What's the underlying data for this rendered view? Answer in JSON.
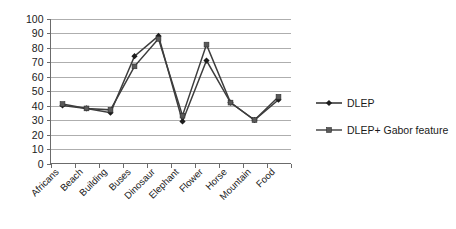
{
  "chart_data": {
    "type": "line",
    "title": "",
    "subtitle": "",
    "xlabel": "",
    "ylabel": "",
    "ylim": [
      0,
      100
    ],
    "ytick_step": 10,
    "yticks": [
      "0",
      "10",
      "20",
      "30",
      "40",
      "50",
      "60",
      "70",
      "80",
      "90",
      "100"
    ],
    "grid": true,
    "legend_position": "right",
    "categories": [
      "Africans",
      "Beach",
      "Building",
      "Buses",
      "Dinosaur",
      "Elephant",
      "Flower",
      "Horse",
      "Mountain",
      "Food"
    ],
    "series": [
      {
        "name": "DLEP",
        "marker": "diamond",
        "color": "#1c1c1c",
        "values": [
          40,
          38,
          35,
          74,
          88,
          29,
          71,
          42,
          30,
          44
        ]
      },
      {
        "name": "DLEP+ Gabor feature",
        "marker": "square",
        "color": "#595959",
        "values": [
          41,
          38,
          37,
          67,
          86,
          33,
          82,
          42,
          30,
          46
        ]
      }
    ]
  },
  "legend": {
    "entries": [
      {
        "label": "DLEP",
        "marker": "diamond"
      },
      {
        "label": "DLEP+ Gabor feature",
        "marker": "square"
      }
    ]
  },
  "colors": {
    "series_dlep": "#1c1c1c",
    "series_gabor": "#595959",
    "gridline": "#9a9a9a",
    "axis": "#6b6b6b",
    "background": "#ffffff",
    "text": "#1a1a1a"
  }
}
